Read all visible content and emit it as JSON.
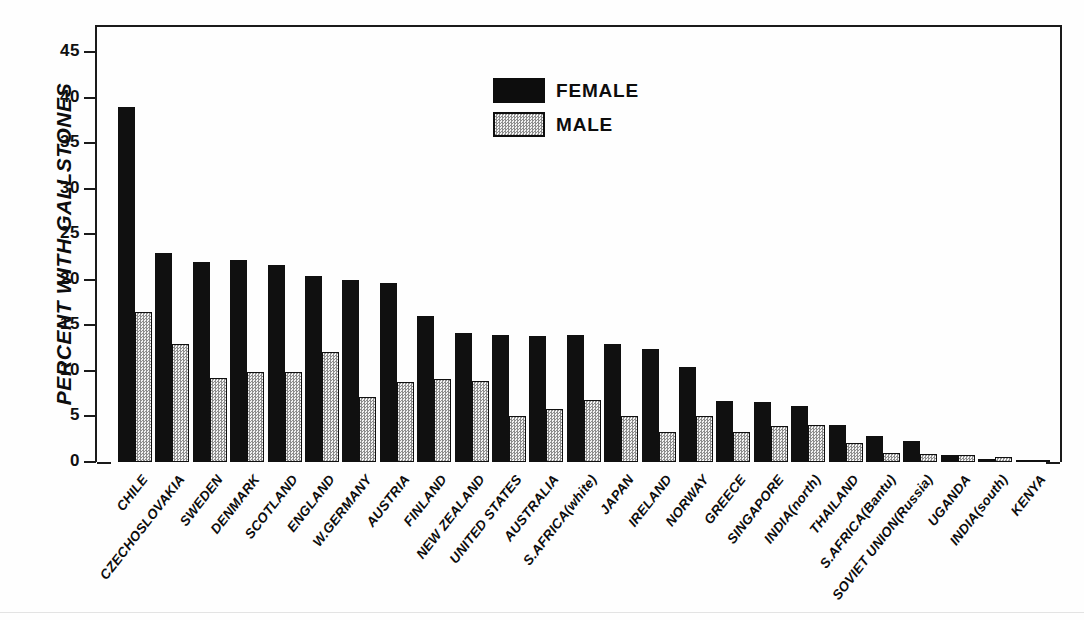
{
  "chart_data": {
    "type": "bar",
    "title": "",
    "xlabel": "",
    "ylabel": "PERCENT WITH GALLSTONES",
    "ylim": [
      0,
      48
    ],
    "yticks": [
      0,
      5,
      10,
      15,
      20,
      25,
      30,
      35,
      40,
      45
    ],
    "ytick_labels": [
      "0",
      "5",
      "10",
      "15",
      "20",
      "25",
      "30",
      "35",
      "40",
      "45"
    ],
    "grid": false,
    "legend_position": "upper-center",
    "categories": [
      "CHILE",
      "CZECHOSLOVAKIA",
      "SWEDEN",
      "DENMARK",
      "SCOTLAND",
      "ENGLAND",
      "W.GERMANY",
      "AUSTRIA",
      "FINLAND",
      "NEW ZEALAND",
      "UNITED STATES",
      "AUSTRALIA",
      "S.AFRICA(white)",
      "JAPAN",
      "IRELAND",
      "NORWAY",
      "GREECE",
      "SINGAPORE",
      "INDIA(north)",
      "THAILAND",
      "S.AFRICA(Bantu)",
      "SOVIET UNION(Russia)",
      "UGANDA",
      "INDIA(south)",
      "KENYA"
    ],
    "series": [
      {
        "name": "FEMALE",
        "color": "#0d0d0d",
        "values": [
          39.0,
          23.0,
          22.0,
          22.2,
          21.6,
          20.4,
          20.0,
          19.7,
          16.0,
          14.2,
          14.0,
          13.8,
          13.9,
          13.0,
          12.4,
          10.4,
          6.7,
          6.6,
          6.1,
          4.1,
          2.9,
          2.3,
          0.8,
          0.3,
          0.15
        ]
      },
      {
        "name": "MALE",
        "color": "#e8e8e8",
        "values": [
          16.5,
          13.0,
          9.2,
          9.9,
          9.9,
          12.1,
          7.1,
          8.8,
          9.1,
          8.9,
          5.0,
          5.8,
          6.8,
          5.1,
          3.3,
          5.1,
          3.3,
          4.0,
          4.1,
          2.1,
          1.0,
          0.9,
          0.8,
          0.5,
          0.1
        ]
      }
    ]
  },
  "legend": {
    "items": [
      {
        "label": "FEMALE",
        "swatch": "solid-black"
      },
      {
        "label": "MALE",
        "swatch": "stippled-gray"
      }
    ]
  }
}
